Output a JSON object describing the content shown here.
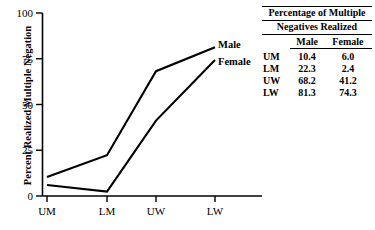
{
  "chart_data": {
    "type": "line",
    "title": "",
    "xlabel": "",
    "ylabel": "Percent Realized Multiple Negation",
    "categories": [
      "UM",
      "LM",
      "UW",
      "LW"
    ],
    "series": [
      {
        "name": "Male",
        "values": [
          10.4,
          22.3,
          68.2,
          81.3
        ]
      },
      {
        "name": "Female",
        "values": [
          6.0,
          2.4,
          41.2,
          74.3
        ]
      }
    ],
    "ylim": [
      0,
      100
    ],
    "yticks": [
      0,
      25,
      50,
      75,
      100
    ],
    "ytick_labels": [
      "0",
      "25",
      "50",
      "75",
      "100"
    ],
    "grid": false,
    "legend_position": "inline-right-of-lines",
    "line_color": "#000000"
  },
  "axis": {
    "y_title": "Percent Realized Multiple Negation",
    "y_tick_labels": [
      "100",
      "75",
      "50",
      "25",
      "0"
    ],
    "x_tick_labels": [
      "UM",
      "LM",
      "UW",
      "LW"
    ]
  },
  "series_labels": {
    "male": "Male",
    "female": "Female"
  },
  "table": {
    "caption_line1": "Percentage of Multiple",
    "caption_line2": "Negatives Realized",
    "col_headers": [
      "Male",
      "Female"
    ],
    "rows": [
      {
        "label": "UM",
        "male": "10.4",
        "female": "6.0"
      },
      {
        "label": "LM",
        "male": "22.3",
        "female": "2.4"
      },
      {
        "label": "UW",
        "male": "68.2",
        "female": "41.2"
      },
      {
        "label": "LW",
        "male": "81.3",
        "female": "74.3"
      }
    ]
  }
}
